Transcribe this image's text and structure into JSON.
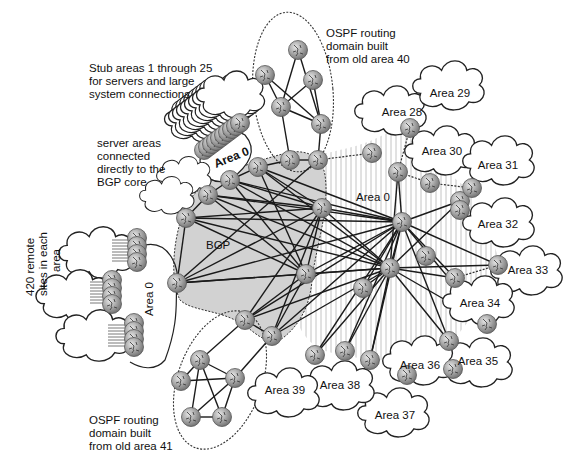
{
  "diagram": {
    "colors": {
      "background": "#ffffff",
      "bgp_core_fill": "#d4d4d4",
      "area0_hatch": "#bdbdbd",
      "router_fill": "#9a9a9a",
      "router_highlight": "#e0e0e0",
      "line": "#1a1a1a"
    },
    "annotations": {
      "stub_areas": [
        "Stub areas 1 through 25",
        "for servers and large",
        "system connections"
      ],
      "server_areas": [
        "server areas",
        "connected",
        "directly to the",
        "BGP core"
      ],
      "remote_sites": [
        "420 remote",
        "sites in each",
        "area"
      ],
      "ospf_domain_40": [
        "OSPF routing",
        "domain built",
        "from old area 40"
      ],
      "ospf_domain_41": [
        "OSPF routing",
        "domain built",
        "from old area 41"
      ]
    },
    "labels": {
      "bgp": "BGP",
      "area0_top": "Area 0",
      "area0_left": "Area 0",
      "area0_right": "Area 0"
    },
    "areas": [
      {
        "name": "Area 28",
        "x": 392,
        "y": 110,
        "lx": 402,
        "ly": 116
      },
      {
        "name": "Area 29",
        "x": 450,
        "y": 85,
        "lx": 450,
        "ly": 97
      },
      {
        "name": "Area 30",
        "x": 442,
        "y": 150,
        "lx": 442,
        "ly": 155
      },
      {
        "name": "Area 31",
        "x": 500,
        "y": 160,
        "lx": 498,
        "ly": 169
      },
      {
        "name": "Area 32",
        "x": 500,
        "y": 222,
        "lx": 498,
        "ly": 228
      },
      {
        "name": "Area 33",
        "x": 528,
        "y": 270,
        "lx": 528,
        "ly": 274
      },
      {
        "name": "Area 34",
        "x": 480,
        "y": 300,
        "lx": 480,
        "ly": 307
      },
      {
        "name": "Area 35",
        "x": 478,
        "y": 362,
        "lx": 478,
        "ly": 365
      },
      {
        "name": "Area 36",
        "x": 420,
        "y": 360,
        "lx": 420,
        "ly": 369
      },
      {
        "name": "Area 37",
        "x": 395,
        "y": 412,
        "lx": 395,
        "ly": 419
      },
      {
        "name": "Area 38",
        "x": 340,
        "y": 385,
        "lx": 340,
        "ly": 389
      },
      {
        "name": "Area 39",
        "x": 285,
        "y": 392,
        "lx": 285,
        "ly": 394
      }
    ],
    "routers": {
      "bgp_core": [
        [
          186,
          218
        ],
        [
          208,
          195
        ],
        [
          230,
          180
        ],
        [
          258,
          167
        ],
        [
          290,
          160
        ],
        [
          318,
          160
        ],
        [
          177,
          283
        ],
        [
          322,
          208
        ],
        [
          306,
          274
        ],
        [
          245,
          320
        ],
        [
          272,
          336
        ]
      ],
      "area0_right": [
        [
          402,
          222
        ],
        [
          390,
          268
        ],
        [
          426,
          256
        ],
        [
          407,
          375
        ],
        [
          453,
          369
        ],
        [
          398,
          172
        ],
        [
          363,
          288
        ],
        [
          455,
          278
        ],
        [
          449,
          341
        ],
        [
          487,
          324
        ],
        [
          498,
          265
        ],
        [
          460,
          201
        ],
        [
          370,
          360
        ],
        [
          345,
          351
        ],
        [
          315,
          355
        ]
      ],
      "ospf40": [
        [
          298,
          50
        ],
        [
          265,
          75
        ],
        [
          313,
          80
        ],
        [
          281,
          107
        ],
        [
          321,
          124
        ]
      ],
      "ospf41": [
        [
          200,
          360
        ],
        [
          181,
          381
        ],
        [
          235,
          378
        ],
        [
          191,
          417
        ],
        [
          222,
          417
        ]
      ],
      "cloud_edge": [
        [
          372,
          153
        ],
        [
          410,
          128
        ],
        [
          430,
          183
        ],
        [
          472,
          188
        ],
        [
          460,
          210
        ]
      ]
    },
    "link_count_note": "Full mesh of links between BGP core and Area 0 routers"
  }
}
